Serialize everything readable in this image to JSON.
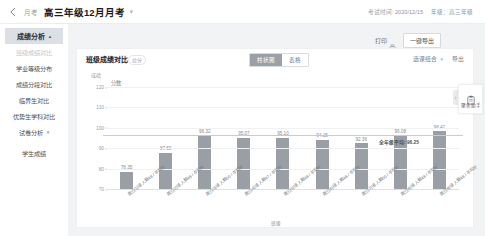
{
  "topbar": {
    "back_icon": "chevron-left-icon",
    "breadcrumb_parent": "月考",
    "breadcrumb_current": "高三年级12月月考",
    "breadcrumb_caret": "▾",
    "exam_time": "考试时间: 2020/12/15",
    "grade": "年级：高三年级"
  },
  "sidebar": {
    "group_label": "成绩分析",
    "group_caret": "▴",
    "items": [
      {
        "label": "班级成绩对比",
        "active": true
      },
      {
        "label": "学业等级分布",
        "active": false
      },
      {
        "label": "成绩分段对比",
        "active": false
      },
      {
        "label": "临界生对比",
        "active": false
      },
      {
        "label": "优势生学科对比",
        "active": false
      }
    ],
    "group2_label": "试卷分析",
    "group2_caret": "▾",
    "item_last": "学生成绩"
  },
  "actions": {
    "print_label": "打印",
    "print_icon": "printer-icon",
    "export_label": "一键导出"
  },
  "card": {
    "title": "班级成绩对比",
    "tag": "总分",
    "segments": [
      {
        "label": "柱状图",
        "active": true
      },
      {
        "label": "表格",
        "active": false
      }
    ],
    "select_label": "选课组合",
    "select_caret": "▾",
    "export_label": "导出"
  },
  "assistant": {
    "icon": "clipboard-icon",
    "label": "聚焦助手",
    "handle_icon": "chevron-right-icon"
  },
  "chart_data": {
    "type": "bar",
    "title": "班级成绩对比",
    "unit_label": "成绩",
    "series_label": "分数",
    "xlabel": "班级",
    "ylabel": "",
    "ylim": [
      70,
      120
    ],
    "yticks": [
      120,
      110,
      100,
      90,
      80,
      70
    ],
    "grid": true,
    "bar_color": "#9a9fa5",
    "avg_line": {
      "value": 96.25,
      "label": "全年级平均: 96.25",
      "color": "#c8ccd1"
    },
    "categories": [
      "高三(1)班 人数49 / 平均分",
      "高三(2)班 人数48 / 平均分",
      "高三(3)班 人数50 / 平均分",
      "高三(4)班 人数47 / 平均分",
      "高三(5)班 人数49 / 平均分",
      "高三(6)班 人数48 / 平均分",
      "高三(7)班 人数50 / 平均分",
      "高三(8)班 人数49 / 平均分",
      "高三(9)班 人数48 / 平均分"
    ],
    "values": [
      78.35,
      87.69,
      96.32,
      95.07,
      95.1,
      94.15,
      92.36,
      96.08,
      98.42
    ],
    "value_labels": [
      "78.35",
      "87.69",
      "96.32",
      "95.07",
      "95.10",
      "94.15",
      "92.36",
      "96.08",
      "98.42"
    ]
  }
}
